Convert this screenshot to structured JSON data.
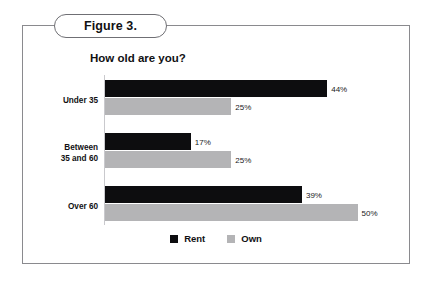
{
  "figure": {
    "pill_label": "Figure 3."
  },
  "chart_data": {
    "type": "bar",
    "orientation": "horizontal",
    "title": "How old are you?",
    "xlabel": "",
    "ylabel": "",
    "xlim": [
      0,
      55
    ],
    "grid": false,
    "legend_position": "bottom",
    "categories": [
      "Under 35",
      "Between\n35 and 60",
      "Over 60"
    ],
    "category_labels": [
      [
        "Under 35"
      ],
      [
        "Between",
        "35 and 60"
      ],
      [
        "Over 60"
      ]
    ],
    "series": [
      {
        "name": "Rent",
        "color": "#0d0d0f",
        "values": [
          44,
          17,
          39
        ],
        "value_labels": [
          "44%",
          "17%",
          "39%"
        ]
      },
      {
        "name": "Own",
        "color": "#b4b4b6",
        "values": [
          25,
          25,
          50
        ],
        "value_labels": [
          "25%",
          "25%",
          "50%"
        ]
      }
    ]
  },
  "legend": {
    "items": [
      {
        "label": "Rent",
        "color": "#0d0d0f"
      },
      {
        "label": "Own",
        "color": "#b4b4b6"
      }
    ]
  }
}
